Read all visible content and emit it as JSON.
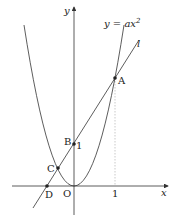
{
  "diagram": {
    "axes": {
      "x_label": "x",
      "y_label": "y",
      "origin_label": "O"
    },
    "ticks": {
      "x_one": "1",
      "y_one": "1"
    },
    "curve": {
      "label": "y = ax²",
      "label_lhs": "y = ",
      "label_a": "ax",
      "label_exp": "2"
    },
    "line": {
      "label": "l"
    },
    "points": [
      {
        "name": "A",
        "label": "A"
      },
      {
        "name": "B",
        "label": "B"
      },
      {
        "name": "C",
        "label": "C"
      },
      {
        "name": "D",
        "label": "D"
      }
    ],
    "colors": {
      "stroke": "#333333",
      "dotted": "#bbbbbb"
    }
  }
}
